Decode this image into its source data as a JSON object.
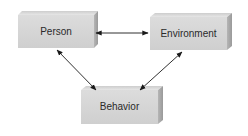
{
  "diagram": {
    "type": "triadic-reciprocal-model",
    "nodes": [
      {
        "id": "person",
        "label": "Person"
      },
      {
        "id": "environment",
        "label": "Environment"
      },
      {
        "id": "behavior",
        "label": "Behavior"
      }
    ],
    "edges": [
      {
        "from": "person",
        "to": "environment",
        "direction": "bidirectional"
      },
      {
        "from": "person",
        "to": "behavior",
        "direction": "bidirectional"
      },
      {
        "from": "environment",
        "to": "behavior",
        "direction": "bidirectional"
      }
    ],
    "colors": {
      "box_front": "#d6d6d6",
      "box_top": "#e4e4e4",
      "box_side": "#a9a9a9",
      "arrow": "#1a1a1a",
      "label": "#2a2a2a"
    }
  }
}
